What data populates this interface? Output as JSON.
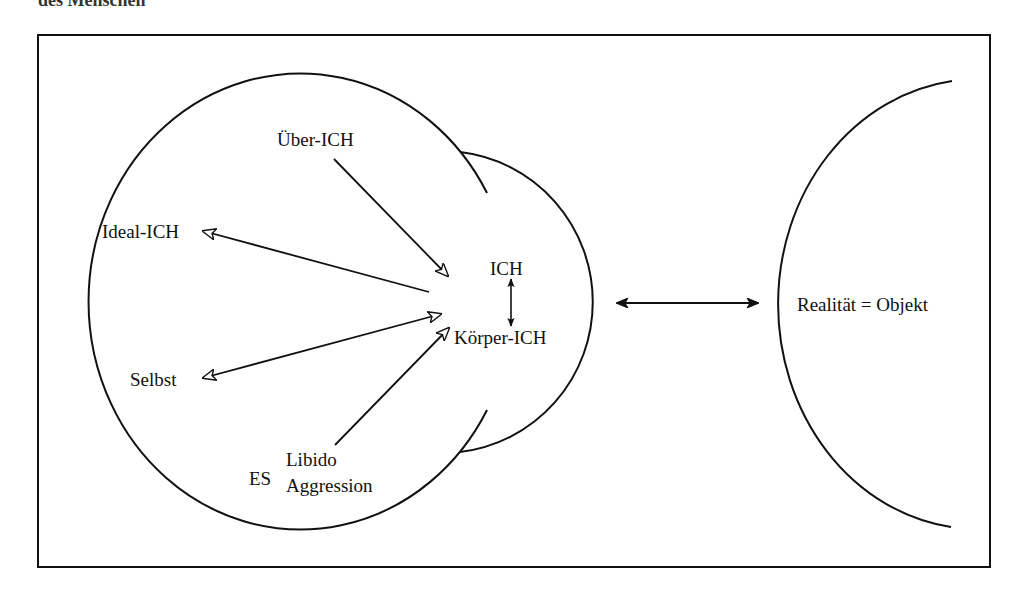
{
  "page": {
    "top_caption_fragment": "des Menschen"
  },
  "diagram": {
    "colors": {
      "ink": "#111111",
      "background": "#ffffff",
      "bleed_through_text": "#d9d9d9"
    },
    "nodes": {
      "ueber_ich": "Über-ICH",
      "ideal_ich": "Ideal-ICH",
      "ich": "ICH",
      "koerper_ich": "Körper-ICH",
      "selbst": "Selbst",
      "es": "ES",
      "libido": "Libido",
      "aggression": "Aggression",
      "realitaet": "Realität = Objekt"
    },
    "edges": [
      {
        "from": "Über-ICH",
        "to": "ICH",
        "head": "hollow",
        "direction": "forward"
      },
      {
        "from": "ICH",
        "to": "Ideal-ICH",
        "head": "hollow",
        "direction": "forward"
      },
      {
        "from": "Selbst",
        "to": "Körper-ICH",
        "head": "hollow",
        "direction": "both"
      },
      {
        "from": "Libido",
        "to": "Körper-ICH",
        "head": "hollow",
        "direction": "forward"
      },
      {
        "from": "ICH",
        "to": "Körper-ICH",
        "head": "filled",
        "direction": "both"
      },
      {
        "from": "psychischer Apparat",
        "to": "Realität = Objekt",
        "head": "filled",
        "direction": "both"
      }
    ]
  }
}
